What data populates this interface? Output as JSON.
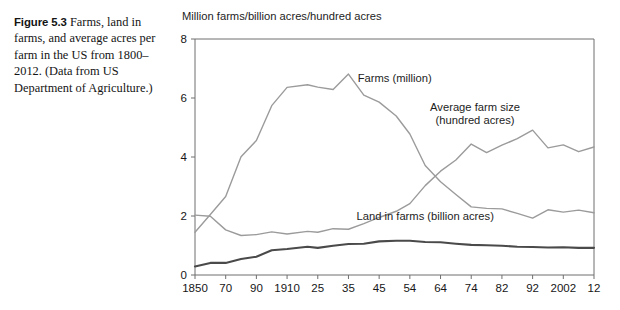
{
  "caption": {
    "figure_number": "Figure 5.3",
    "text": "Farms, land in farms, and average acres per farm in the US from 1800–2012. (Data from US Department of Agriculture.)"
  },
  "chart_data": {
    "type": "line",
    "title": "",
    "ylabel": "Million farms/billion acres/hundred acres",
    "xlabel": "",
    "ylim": [
      0,
      8
    ],
    "yticks": [
      0,
      2,
      4,
      6,
      8
    ],
    "yticklabels": [
      "0",
      "2",
      "4",
      "6",
      "8"
    ],
    "xticklabels": [
      "1850",
      "70",
      "90",
      "1910",
      "25",
      "35",
      "45",
      "54",
      "64",
      "74",
      "82",
      "92",
      "2002",
      "12"
    ],
    "xtickvalues": [
      1850,
      1870,
      1890,
      1910,
      1925,
      1935,
      1945,
      1954,
      1964,
      1974,
      1982,
      1992,
      2002,
      2012
    ],
    "xlim": [
      1850,
      2012
    ],
    "grid": false,
    "legend_position": "inline-annotations",
    "series": [
      {
        "name": "Farms (million)",
        "color": "#9b9b9b",
        "width": 1.4,
        "label_x": 1938,
        "label_y": 6.55,
        "label_anchor": "start",
        "x": [
          1850,
          1860,
          1870,
          1880,
          1890,
          1900,
          1910,
          1920,
          1925,
          1930,
          1935,
          1940,
          1945,
          1950,
          1954,
          1959,
          1964,
          1969,
          1974,
          1978,
          1982,
          1987,
          1992,
          1997,
          2002,
          2007,
          2012
        ],
        "y": [
          1.45,
          2.05,
          2.66,
          4.01,
          4.56,
          5.74,
          6.36,
          6.45,
          6.37,
          6.29,
          6.81,
          6.1,
          5.86,
          5.39,
          4.78,
          3.71,
          3.16,
          2.73,
          2.31,
          2.26,
          2.24,
          2.09,
          1.93,
          2.21,
          2.13,
          2.2,
          2.11
        ]
      },
      {
        "name": "Average farm size (hundred acres)",
        "color": "#9b9b9b",
        "width": 1.4,
        "label_x": 1975,
        "label_y": 5.55,
        "label_anchor": "middle",
        "label_lines": [
          "Average farm size",
          "(hundred acres)"
        ],
        "x": [
          1850,
          1860,
          1870,
          1880,
          1890,
          1900,
          1910,
          1920,
          1925,
          1930,
          1935,
          1940,
          1945,
          1950,
          1954,
          1959,
          1964,
          1969,
          1974,
          1978,
          1982,
          1987,
          1992,
          1997,
          2002,
          2007,
          2012
        ],
        "y": [
          2.03,
          1.99,
          1.53,
          1.34,
          1.37,
          1.46,
          1.39,
          1.48,
          1.45,
          1.57,
          1.55,
          1.74,
          1.95,
          2.16,
          2.42,
          3.03,
          3.52,
          3.9,
          4.44,
          4.15,
          4.4,
          4.62,
          4.91,
          4.31,
          4.41,
          4.18,
          4.34
        ]
      },
      {
        "name": "Land in farms (billion acres)",
        "color": "#4a4a4a",
        "width": 2.1,
        "label_x": 1959,
        "label_y": 1.85,
        "label_anchor": "middle",
        "x": [
          1850,
          1860,
          1870,
          1880,
          1890,
          1900,
          1910,
          1920,
          1925,
          1930,
          1935,
          1940,
          1945,
          1950,
          1954,
          1959,
          1964,
          1969,
          1974,
          1978,
          1982,
          1987,
          1992,
          1997,
          2002,
          2007,
          2012
        ],
        "y": [
          0.29,
          0.41,
          0.41,
          0.54,
          0.62,
          0.84,
          0.88,
          0.96,
          0.92,
          0.99,
          1.05,
          1.06,
          1.14,
          1.16,
          1.16,
          1.12,
          1.11,
          1.06,
          1.02,
          1.01,
          0.99,
          0.96,
          0.95,
          0.93,
          0.94,
          0.92,
          0.92
        ]
      }
    ]
  }
}
